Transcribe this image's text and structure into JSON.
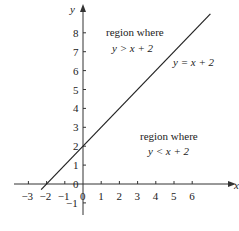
{
  "chart_data": {
    "type": "line",
    "title": "",
    "xlabel": "x",
    "ylabel": "y",
    "xlim": [
      -3.5,
      7
    ],
    "ylim": [
      -1.5,
      9
    ],
    "grid": false,
    "x_ticks": [
      -3,
      -2,
      -1,
      0,
      1,
      2,
      3,
      4,
      5,
      6
    ],
    "y_ticks": [
      -1,
      0,
      1,
      2,
      3,
      4,
      5,
      6,
      7,
      8
    ],
    "series": [
      {
        "name": "y = x + 2",
        "x": [
          -2.3,
          7.0
        ],
        "y": [
          -0.3,
          9.0
        ]
      }
    ],
    "annotations": [
      {
        "text_line1": "region where",
        "text_line2": "y > x + 2",
        "x": 2.4,
        "y": 8.2
      },
      {
        "text_line1": "region where",
        "text_line2": "y < x + 2",
        "x": 4.6,
        "y": 2.4
      },
      {
        "text": "y = x + 2",
        "x": 6.1,
        "y": 6.7
      }
    ]
  },
  "labels": {
    "x_axis": "x",
    "y_axis": "y",
    "line_label": "y = x + 2",
    "upper_region_line1": "region where",
    "upper_region_line2": "y > x + 2",
    "lower_region_line1": "region where",
    "lower_region_line2": "y < x + 2"
  },
  "colors": {
    "axis": "#333333",
    "line": "#222222",
    "text": "#222222"
  }
}
